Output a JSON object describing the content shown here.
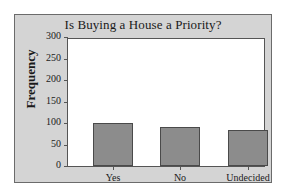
{
  "chart_data": {
    "type": "bar",
    "title": "Is Buying a House a Priority?",
    "xlabel": "",
    "ylabel": "Frequency",
    "categories": [
      "Yes",
      "No",
      "Undecided"
    ],
    "values": [
      101,
      93,
      84
    ],
    "ylim": [
      0,
      300
    ],
    "yticks": [
      0,
      50,
      100,
      150,
      200,
      250,
      300
    ],
    "ytick_labels": [
      "0",
      "50",
      "100",
      "150",
      "200",
      "250",
      "300"
    ],
    "grid": false,
    "legend": false,
    "bar_color": "#8c8c8c",
    "bar_edge_color": "#4a4a4a",
    "figure_background": "#d4d4d4",
    "plot_background": "#ffffff",
    "axis_color": "#555555",
    "text_color": "#1a1a1a"
  }
}
